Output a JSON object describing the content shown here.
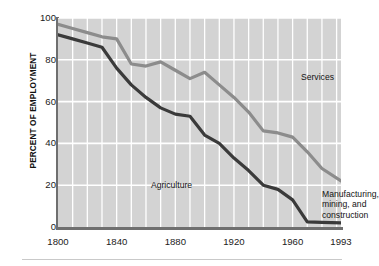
{
  "chart_data": {
    "type": "line",
    "title": "",
    "subtitle": "",
    "xlabel": "",
    "ylabel": "PERCENT OF EMPLOYMENT",
    "xlim": [
      1800,
      1993
    ],
    "ylim": [
      0,
      100
    ],
    "grid": true,
    "grid_color": "#ffffff",
    "plot_background": "#d3d3d3",
    "legend": "inline annotations",
    "x_ticks": [
      1800,
      1840,
      1880,
      1920,
      1960,
      1993
    ],
    "x_tick_labels": [
      "1800",
      "1840",
      "1880",
      "1920",
      "1960",
      "1993"
    ],
    "y_ticks": [
      0,
      20,
      40,
      60,
      80,
      100
    ],
    "y_tick_labels": [
      "0",
      "20",
      "40",
      "60",
      "80",
      "100"
    ],
    "x_minor_gridline_step": 10,
    "series": [
      {
        "name": "Services",
        "color": "#8c8c8c",
        "label_text": "Services",
        "x": [
          1800,
          1810,
          1820,
          1830,
          1840,
          1850,
          1860,
          1870,
          1880,
          1890,
          1900,
          1910,
          1920,
          1930,
          1940,
          1950,
          1960,
          1970,
          1980,
          1993
        ],
        "values": [
          97,
          95,
          93,
          91,
          90,
          78,
          77,
          79,
          75,
          71,
          74,
          68,
          62,
          55,
          46,
          45,
          43,
          36,
          28,
          22
        ]
      },
      {
        "name": "Manufacturing, mining, and construction",
        "color": "#3a3a3a",
        "label_text": "Manufacturing,\nmining, and\nconstruction",
        "x": [
          1800,
          1810,
          1820,
          1830,
          1840,
          1850,
          1860,
          1870,
          1880,
          1890,
          1900,
          1910,
          1920,
          1930,
          1940,
          1950,
          1960,
          1970,
          1980,
          1993
        ],
        "values": [
          92,
          90,
          88,
          86,
          76,
          68,
          62,
          57,
          54,
          53,
          44,
          40,
          33,
          27,
          20,
          18,
          13,
          2.5,
          2.2,
          2
        ]
      }
    ],
    "annotations": [
      {
        "text": "Services",
        "x": 1945,
        "y": 79,
        "name": "services-label"
      },
      {
        "text": "Agriculture",
        "x": 1836,
        "y": 27,
        "name": "agriculture-label"
      },
      {
        "text": "Manufacturing,\nmining, and\nconstruction",
        "x": 1960,
        "y": 22,
        "name": "manufacturing-label"
      }
    ]
  },
  "axes": {
    "y_title": "PERCENT OF EMPLOYMENT",
    "y_tick_labels": [
      "100",
      "80",
      "60",
      "40",
      "20",
      "0"
    ],
    "x_tick_labels": [
      "1800",
      "1840",
      "1880",
      "1920",
      "1960",
      "1993"
    ]
  },
  "labels": {
    "services": "Services",
    "agriculture": "Agriculture",
    "manufacturing": "Manufacturing,\nmining, and\nconstruction"
  },
  "colors": {
    "services_line": "#8c8c8c",
    "manufacturing_line": "#3a3a3a",
    "plot_background": "#d3d3d3",
    "gridline": "#ffffff",
    "axis": "#6f6f6f"
  }
}
